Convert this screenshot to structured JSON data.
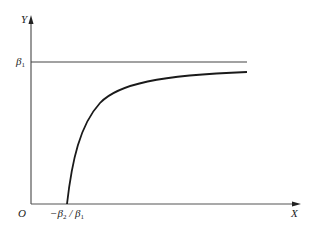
{
  "diagram": {
    "type": "function-curve",
    "axes": {
      "x_label": "X",
      "y_label": "Y",
      "origin_label": "O"
    },
    "asymptote": {
      "label": "β",
      "label_sub": "1"
    },
    "x_intercept": {
      "prefix": "−β",
      "sub1": "2",
      "sep": " / β",
      "sub2": "1"
    },
    "colors": {
      "axis": "#555555",
      "curve": "#1a1a1a",
      "asymptote": "#444444"
    }
  }
}
